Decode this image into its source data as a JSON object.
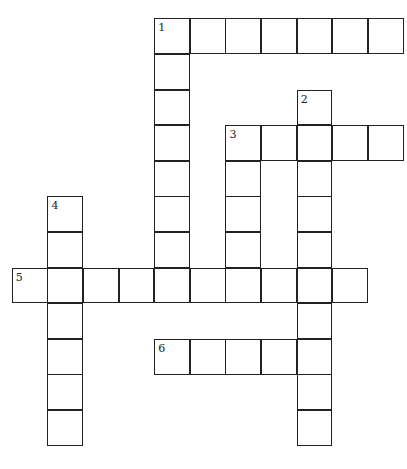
{
  "puzzle": {
    "type": "crossword",
    "cell_size": 35.6,
    "origin": {
      "x": 12.5,
      "y": 19
    },
    "words": [
      {
        "number": "1",
        "direction": "across",
        "row": 0,
        "col": 4,
        "length": 7
      },
      {
        "number": "1",
        "direction": "down",
        "row": 0,
        "col": 4,
        "length": 8
      },
      {
        "number": "2",
        "direction": "down",
        "row": 2,
        "col": 8,
        "length": 10
      },
      {
        "number": "3",
        "direction": "across",
        "row": 3,
        "col": 6,
        "length": 5
      },
      {
        "number": "3",
        "direction": "down",
        "row": 3,
        "col": 6,
        "length": 5
      },
      {
        "number": "4",
        "direction": "down",
        "row": 5,
        "col": 1,
        "length": 7
      },
      {
        "number": "5",
        "direction": "across",
        "row": 7,
        "col": 0,
        "length": 10
      },
      {
        "number": "6",
        "direction": "across",
        "row": 9,
        "col": 4,
        "length": 5
      }
    ],
    "labels": [
      {
        "number": "1",
        "row": 0,
        "col": 4
      },
      {
        "number": "2",
        "row": 2,
        "col": 8
      },
      {
        "number": "3",
        "row": 3,
        "col": 6
      },
      {
        "number": "4",
        "row": 5,
        "col": 1
      },
      {
        "number": "5",
        "row": 7,
        "col": 0
      },
      {
        "number": "6",
        "row": 9,
        "col": 4
      }
    ]
  }
}
